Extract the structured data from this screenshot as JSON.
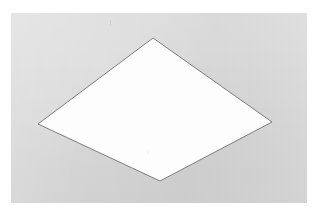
{
  "figure": {
    "shape_name": "rhombus",
    "caption": "",
    "background_color": "#d8d8d8",
    "page_color": "#ffffff",
    "shape_fill": "#fdfdfd",
    "shape_stroke": "#7c7c7c",
    "stroke_width": 1,
    "plate": {
      "x": 11,
      "y": 13,
      "width": 296,
      "height": 190
    },
    "vertices": [
      {
        "name": "top",
        "x": 153,
        "y": 38
      },
      {
        "name": "right",
        "x": 272,
        "y": 122
      },
      {
        "name": "bottom",
        "x": 160,
        "y": 181
      },
      {
        "name": "left",
        "x": 38,
        "y": 124
      }
    ],
    "polygon_points": "153,38 272,122 160,181 38,124",
    "marks": [
      {
        "name": "stray-mark-top",
        "x": 110,
        "y": 20
      },
      {
        "name": "stray-mark-inner",
        "x": 147,
        "y": 150
      }
    ]
  }
}
